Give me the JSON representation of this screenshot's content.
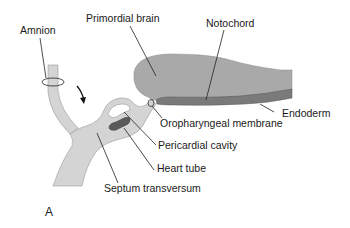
{
  "figure": {
    "panel_label": "A",
    "labels": {
      "amnion": "Amnion",
      "primordial_brain": "Primordial brain",
      "notochord": "Notochord",
      "endoderm": "Endoderm",
      "oropharyngeal_membrane": "Oropharyngeal membrane",
      "pericardial_cavity": "Pericardial cavity",
      "heart_tube": "Heart tube",
      "septum_transversum": "Septum transversum"
    },
    "colors": {
      "tissue_light": "#d4d4d4",
      "brain": "#a9a9a9",
      "endoderm_band": "#7a7a7a",
      "heart_tube": "#5a5a5a",
      "outline": "#666666",
      "text": "#1a1a1a"
    }
  }
}
